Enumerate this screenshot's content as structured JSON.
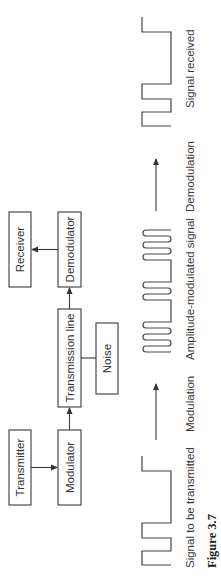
{
  "figure": {
    "caption": "Figure 3.7",
    "orientation": "rotated 90 degrees counterclockwise"
  },
  "block_diagram": {
    "blocks": {
      "transmitter": "Transmitter",
      "modulator": "Modulator",
      "transmission_line": "Transmission line",
      "noise": "Noise",
      "demodulator": "Demodulator",
      "receiver": "Receiver"
    },
    "connections": [
      {
        "from": "Transmitter",
        "to": "Modulator"
      },
      {
        "from": "Modulator",
        "to": "Transmission line"
      },
      {
        "from": "Noise",
        "to": "Transmission line"
      },
      {
        "from": "Transmission line",
        "to": "Demodulator"
      },
      {
        "from": "Demodulator",
        "to": "Receiver"
      }
    ]
  },
  "signal_row": {
    "labels": {
      "signal_transmitted": "Signal to be transmitted",
      "modulation": "Modulation",
      "am_signal": "Amplitude-modulated signal",
      "demodulation": "Demodulation",
      "signal_received": "Signal received"
    },
    "stages": [
      "Signal to be transmitted",
      "Modulation",
      "Amplitude-modulated signal",
      "Demodulation",
      "Signal received"
    ]
  }
}
